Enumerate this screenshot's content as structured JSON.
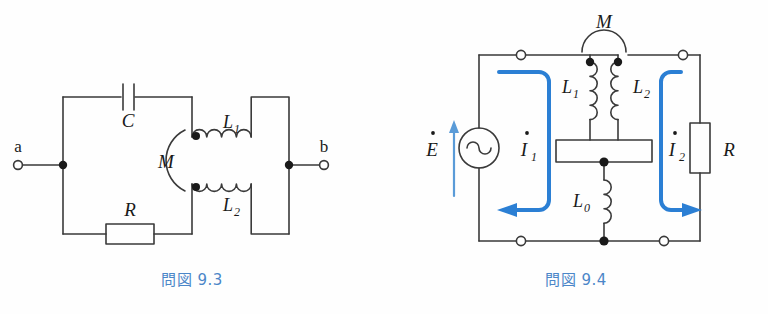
{
  "page": {
    "width": 768,
    "height": 314,
    "background": "#fefefe",
    "line_color": "#3a3a3a",
    "text_color": "#1a1a1a",
    "accent_color": "#2b7fd4",
    "caption_color": "#4b86c8"
  },
  "figures": [
    {
      "id": "fig-9-3",
      "caption": "問図 9.3",
      "caption_prefix": "問図",
      "caption_number": "9.3",
      "description": "Two-terminal network between terminals a and b containing a capacitor C, a resistor R and two mutually coupled inductors L1 and L2 with mutual inductance M.",
      "terminals": [
        {
          "name": "a",
          "label": "a",
          "side": "left"
        },
        {
          "name": "b",
          "label": "b",
          "side": "right"
        }
      ],
      "components": [
        {
          "name": "capacitor",
          "label": "C",
          "symbol": "capacitor"
        },
        {
          "name": "resistor",
          "label": "R",
          "symbol": "resistor"
        },
        {
          "name": "inductor-top",
          "label": "L",
          "sub": "1",
          "symbol": "inductor",
          "dot": true
        },
        {
          "name": "inductor-bottom",
          "label": "L",
          "sub": "2",
          "symbol": "inductor",
          "dot": true
        },
        {
          "name": "mutual-coupling",
          "label": "M",
          "symbol": "mutual-inductance-arc"
        }
      ]
    },
    {
      "id": "fig-9-4",
      "caption": "問図 9.4",
      "caption_prefix": "問図",
      "caption_number": "9.4",
      "description": "AC source E drives current I1 through coupled coils L1 and L2 with mutual inductance M, a shared inductor L0 and load resistor R carrying current I2.",
      "terminals": [
        {
          "name": "terminal-top-left",
          "label": "",
          "style": "open"
        },
        {
          "name": "terminal-top-right",
          "label": "",
          "style": "open"
        },
        {
          "name": "terminal-bottom-left",
          "label": "",
          "style": "open"
        },
        {
          "name": "terminal-bottom-right",
          "label": "",
          "style": "open"
        }
      ],
      "components": [
        {
          "name": "ac-source",
          "label": "E",
          "accent": "dot",
          "symbol": "ac-source"
        },
        {
          "name": "inductor-l1",
          "label": "L",
          "sub": "1",
          "symbol": "inductor",
          "dot": true
        },
        {
          "name": "inductor-l2",
          "label": "L",
          "sub": "2",
          "symbol": "inductor",
          "dot": true
        },
        {
          "name": "inductor-l0",
          "label": "L",
          "sub": "0",
          "symbol": "inductor",
          "dot": false
        },
        {
          "name": "mutual-coupling",
          "label": "M",
          "symbol": "mutual-inductance-arc"
        },
        {
          "name": "resistor",
          "label": "R",
          "symbol": "resistor"
        }
      ],
      "currents": [
        {
          "name": "current-i1",
          "label": "I",
          "sub": "1",
          "accent": "dot",
          "direction": "counter-clockwise"
        },
        {
          "name": "current-i2",
          "label": "I",
          "sub": "2",
          "accent": "dot",
          "direction": "clockwise"
        }
      ],
      "source_arrow": {
        "name": "emf-arrow",
        "direction": "up",
        "color": "#4a90d9"
      }
    }
  ]
}
